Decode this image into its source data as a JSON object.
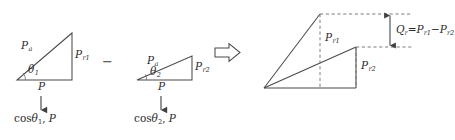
{
  "figure": {
    "title_text": "",
    "colors": {
      "stroke": "#4a4a4a",
      "dashed": "#6e6e6e",
      "text": "#2b2b2b"
    },
    "operator_minus": "−",
    "operator_implies": "implies-arrow"
  },
  "triangle1": {
    "name": "triangle-one",
    "hypotenuse_label": "P",
    "hypotenuse_sub": "a",
    "vertical_label": "P",
    "vertical_sub": "r1",
    "base_label": "P",
    "angle_label": "θ",
    "angle_sub": "1",
    "annotation_fn": "cos",
    "annotation_angle": "θ",
    "annotation_angle_sub": "1",
    "annotation_sep": ", ",
    "annotation_var": "P",
    "arrow": "down-arrow"
  },
  "triangle2": {
    "name": "triangle-two",
    "hypotenuse_label": "P",
    "hypotenuse_sub": "a",
    "vertical_label": "P",
    "vertical_sub": "r2",
    "base_label": "P",
    "angle_label": "θ",
    "angle_sub": "2",
    "annotation_fn": "cos",
    "annotation_angle": "θ",
    "annotation_angle_sub": "2",
    "annotation_sep": ", ",
    "annotation_var": "P",
    "arrow": "down-arrow"
  },
  "result": {
    "name": "combined-figure",
    "upper_label": "P",
    "upper_sub": "r1",
    "lower_label": "P",
    "lower_sub": "r2",
    "equation_lhs": "Q",
    "equation_lhs_sub": "r",
    "equation_eq": "=",
    "equation_t1": "P",
    "equation_t1_sub": "r1",
    "equation_minus": "−",
    "equation_t2": "P",
    "equation_t2_sub": "r2",
    "measure_arrow": "double-headed-vertical-arrow"
  }
}
